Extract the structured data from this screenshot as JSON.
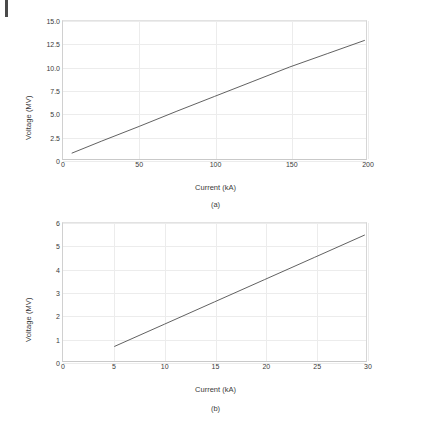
{
  "figure": {
    "page_mark": "page-edge-rule",
    "panels": [
      {
        "caption": "(a)",
        "xlabel": "Current (kA)",
        "ylabel": "Voltage (MV)"
      },
      {
        "caption": "(b)",
        "xlabel": "Current (kA)",
        "ylabel": "Voltage (MV)"
      }
    ]
  },
  "chart_data": [
    {
      "type": "line",
      "title": "",
      "panel_label": "(a)",
      "xlabel": "Current (kA)",
      "ylabel": "Voltage (MV)",
      "xlim": [
        0,
        200
      ],
      "ylim": [
        0,
        15
      ],
      "xticks": [
        0,
        50,
        100,
        150,
        200
      ],
      "xtick_labels": [
        "0",
        "50",
        "100",
        "150",
        "200"
      ],
      "yticks": [
        0,
        2.5,
        5.0,
        7.5,
        10.0,
        12.5,
        15.0
      ],
      "ytick_labels": [
        "0",
        "2.5",
        "5.0",
        "7.5",
        "10.0",
        "12.5",
        "15.0"
      ],
      "grid": true,
      "legend": false,
      "series": [
        {
          "name": "Voltage vs Current",
          "color": "#4d4d4d",
          "x": [
            5,
            25,
            50,
            75,
            100,
            125,
            150,
            175,
            200
          ],
          "y": [
            0.63,
            1.95,
            3.55,
            5.2,
            6.8,
            8.4,
            10.0,
            11.45,
            12.9
          ]
        }
      ]
    },
    {
      "type": "line",
      "title": "",
      "panel_label": "(b)",
      "xlabel": "Current (kA)",
      "ylabel": "Voltage (MV)",
      "xlim": [
        0,
        30
      ],
      "ylim": [
        0,
        6
      ],
      "xticks": [
        0,
        5,
        10,
        15,
        20,
        25,
        30
      ],
      "xtick_labels": [
        "0",
        "5",
        "10",
        "15",
        "20",
        "25",
        "30"
      ],
      "yticks": [
        0,
        1,
        2,
        3,
        4,
        5,
        6
      ],
      "ytick_labels": [
        "0",
        "1",
        "2",
        "3",
        "4",
        "5",
        "6"
      ],
      "grid": true,
      "legend": false,
      "series": [
        {
          "name": "Voltage vs Current",
          "color": "#4d4d4d",
          "x": [
            5,
            10,
            15,
            20,
            25,
            30
          ],
          "y": [
            0.63,
            1.6,
            2.57,
            3.54,
            4.51,
            5.48
          ]
        }
      ]
    }
  ],
  "colors": {
    "line": "#4d4d4d",
    "grid": "#ececec",
    "axis": "#d0d0d0",
    "text": "#3a3a3a",
    "background": "#ffffff"
  }
}
